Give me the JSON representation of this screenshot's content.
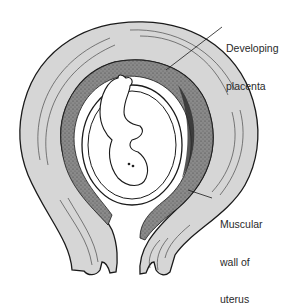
{
  "diagram": {
    "labels": [
      {
        "id": "placenta",
        "line1": "Developing",
        "line2": "placenta",
        "line3": ""
      },
      {
        "id": "uterus-wall",
        "line1": "Muscular",
        "line2": "wall of",
        "line3": "uterus"
      }
    ],
    "colors": {
      "outline": "#1a1a1a",
      "muscle_fill": "#d4d4d4",
      "placenta_fill": "#7a7a7a",
      "placenta_dark": "#3a3a3a",
      "amniotic_fill": "#ffffff",
      "background": "#ffffff"
    }
  }
}
